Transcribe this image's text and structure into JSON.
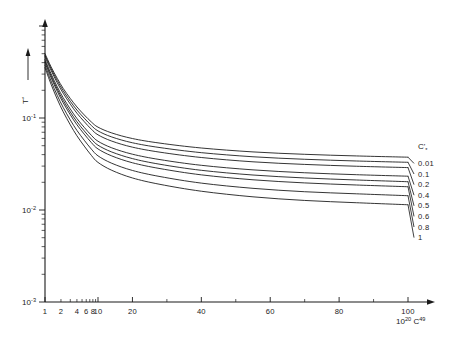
{
  "chart_data": {
    "type": "line",
    "title": "",
    "subtitle": "",
    "xlabel": "10²⁰ C⁴⁹",
    "ylabel": "T*",
    "xscale": "log",
    "yscale": "log",
    "xlim": [
      1,
      105
    ],
    "ylim": [
      0.001,
      1
    ],
    "grid": false,
    "legend_position": "right",
    "legend_title": "C'*",
    "x_tick_labels": [
      "1",
      "2",
      "4",
      "6",
      "8",
      "10",
      "20",
      "40",
      "60",
      "80",
      "100"
    ],
    "x_tick_values": [
      1,
      2,
      4,
      6,
      8,
      10,
      20,
      40,
      60,
      80,
      100
    ],
    "y_tick_labels": [
      "10⁻¹",
      "10⁻²",
      "10⁻³"
    ],
    "y_tick_values": [
      0.1,
      0.01,
      0.001
    ],
    "y_axis_arrow": true,
    "x_axis_arrow": true,
    "series": [
      {
        "name": "0.01",
        "label": "0.01",
        "x": [
          1,
          1.3,
          1.7,
          2.2,
          3,
          4,
          5.5,
          7.5,
          10,
          14,
          20,
          28,
          40,
          55,
          70,
          85,
          100
        ],
        "y": [
          0.5,
          0.36,
          0.27,
          0.21,
          0.163,
          0.132,
          0.108,
          0.0905,
          0.0795,
          0.0688,
          0.0598,
          0.0533,
          0.0472,
          0.0428,
          0.0403,
          0.0387,
          0.0375
        ]
      },
      {
        "name": "0.1",
        "label": "0.1",
        "x": [
          1,
          1.3,
          1.7,
          2.2,
          3,
          4,
          5.5,
          7.5,
          10,
          14,
          20,
          28,
          40,
          55,
          70,
          85,
          100
        ],
        "y": [
          0.48,
          0.345,
          0.256,
          0.198,
          0.152,
          0.122,
          0.0995,
          0.0828,
          0.0724,
          0.0622,
          0.0538,
          0.0477,
          0.042,
          0.0379,
          0.0356,
          0.0341,
          0.033
        ]
      },
      {
        "name": "0.2",
        "label": "0.2",
        "x": [
          1,
          1.3,
          1.7,
          2.2,
          3,
          4,
          5.5,
          7.5,
          10,
          14,
          20,
          28,
          40,
          55,
          70,
          85,
          100
        ],
        "y": [
          0.462,
          0.33,
          0.242,
          0.186,
          0.1415,
          0.1128,
          0.0913,
          0.0755,
          0.0656,
          0.0561,
          0.0482,
          0.0425,
          0.0372,
          0.0334,
          0.0313,
          0.0299,
          0.0289
        ]
      },
      {
        "name": "0.4",
        "label": "0.4",
        "x": [
          1,
          1.3,
          1.7,
          2.2,
          3,
          4,
          5.5,
          7.5,
          10,
          14,
          20,
          28,
          40,
          55,
          70,
          85,
          100
        ],
        "y": [
          0.432,
          0.303,
          0.219,
          0.1665,
          0.1252,
          0.0988,
          0.0791,
          0.0648,
          0.0559,
          0.0474,
          0.0404,
          0.0353,
          0.0306,
          0.0273,
          0.0254,
          0.0242,
          0.0233
        ]
      },
      {
        "name": "0.5",
        "label": "0.5",
        "x": [
          1,
          1.3,
          1.7,
          2.2,
          3,
          4,
          5.5,
          7.5,
          10,
          14,
          20,
          28,
          40,
          55,
          70,
          85,
          100
        ],
        "y": [
          0.415,
          0.288,
          0.2065,
          0.1558,
          0.1162,
          0.0911,
          0.0725,
          0.059,
          0.0506,
          0.0427,
          0.0362,
          0.0314,
          0.027,
          0.024,
          0.0223,
          0.0212,
          0.0203
        ]
      },
      {
        "name": "0.6",
        "label": "0.6",
        "x": [
          1,
          1.3,
          1.7,
          2.2,
          3,
          4,
          5.5,
          7.5,
          10,
          14,
          20,
          28,
          40,
          55,
          70,
          85,
          100
        ],
        "y": [
          0.4,
          0.275,
          0.1955,
          0.1465,
          0.1085,
          0.0845,
          0.0668,
          0.054,
          0.0461,
          0.0387,
          0.0326,
          0.0282,
          0.0241,
          0.0213,
          0.0197,
          0.0187,
          0.0179
        ]
      },
      {
        "name": "0.8",
        "label": "0.8",
        "x": [
          1,
          1.3,
          1.7,
          2.2,
          3,
          4,
          5.5,
          7.5,
          10,
          14,
          20,
          28,
          40,
          55,
          70,
          85,
          100
        ],
        "y": [
          0.375,
          0.2525,
          0.1765,
          0.1305,
          0.0952,
          0.0733,
          0.0573,
          0.0459,
          0.0388,
          0.0322,
          0.0269,
          0.0231,
          0.0196,
          0.0172,
          0.0158,
          0.015,
          0.0143
        ]
      },
      {
        "name": "1",
        "label": "1",
        "x": [
          1,
          1.3,
          1.7,
          2.2,
          3,
          4,
          5.5,
          7.5,
          10,
          14,
          20,
          28,
          40,
          55,
          70,
          85,
          100
        ],
        "y": [
          0.352,
          0.233,
          0.1605,
          0.1172,
          0.0843,
          0.0641,
          0.0495,
          0.0392,
          0.0329,
          0.027,
          0.0223,
          0.019,
          0.016,
          0.0139,
          0.0127,
          0.012,
          0.0114
        ]
      }
    ]
  },
  "axis": {
    "y_label_text": "T",
    "y_label_star": "*",
    "x_label_mantissa": "10",
    "x_label_exp1": "20",
    "x_label_c": "C",
    "x_label_exp2": "49"
  },
  "legend": {
    "title_base": "C'",
    "title_star": "*"
  }
}
